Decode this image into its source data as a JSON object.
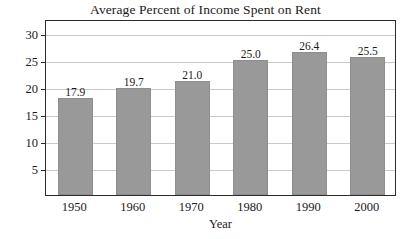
{
  "chart_data": {
    "type": "bar",
    "title": "Average Percent of Income Spent on Rent",
    "xlabel": "Year",
    "ylabel": "Percent",
    "categories": [
      "1950",
      "1960",
      "1970",
      "1980",
      "1990",
      "2000"
    ],
    "values": [
      17.9,
      19.7,
      21.0,
      25.0,
      26.4,
      25.5
    ],
    "value_labels": [
      "17.9",
      "19.7",
      "21.0",
      "25.0",
      "26.4",
      "25.5"
    ],
    "ylim": [
      0,
      32.5
    ],
    "yticks": [
      5,
      10,
      15,
      20,
      25,
      30
    ],
    "ytick_labels": [
      "5",
      "10",
      "15",
      "20",
      "25",
      "30"
    ],
    "grid": true,
    "legend": false,
    "series_color": "#999999",
    "axis_color": "#2b2b2b",
    "grid_color": "#c9c9c9"
  }
}
